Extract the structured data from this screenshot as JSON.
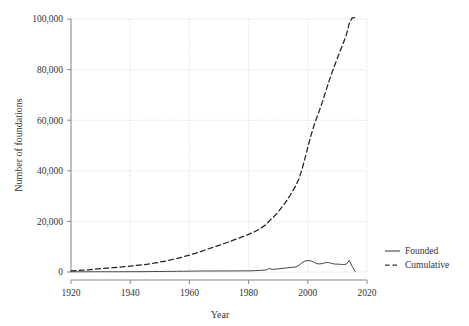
{
  "chart_data": {
    "type": "line",
    "title": "",
    "subtitle": "",
    "xlabel": "Year",
    "ylabel": "Number of foundations",
    "xlim": [
      1920,
      2020
    ],
    "ylim": [
      0,
      100000
    ],
    "xticks": [
      1920,
      1940,
      1960,
      1980,
      2000,
      2020
    ],
    "xtick_labels": [
      "1920",
      "1940",
      "1960",
      "1980",
      "2000",
      "2020"
    ],
    "yticks": [
      0,
      20000,
      40000,
      60000,
      80000,
      100000
    ],
    "ytick_labels": [
      "0",
      "20,000",
      "40,000",
      "60,000",
      "80,000",
      "100,000"
    ],
    "grid": true,
    "grid_style": "dotted",
    "grid_color": "#cccccc",
    "legend_position": "right",
    "legend": [
      "Founded",
      "Cumulative"
    ],
    "x": [
      1920,
      1922,
      1924,
      1926,
      1928,
      1930,
      1932,
      1934,
      1936,
      1938,
      1940,
      1942,
      1944,
      1946,
      1948,
      1950,
      1952,
      1954,
      1956,
      1958,
      1960,
      1962,
      1964,
      1966,
      1968,
      1970,
      1972,
      1974,
      1976,
      1978,
      1980,
      1982,
      1984,
      1986,
      1987,
      1988,
      1990,
      1992,
      1994,
      1996,
      1997,
      1998,
      1999,
      2000,
      2001,
      2002,
      2003,
      2004,
      2005,
      2006,
      2007,
      2008,
      2009,
      2010,
      2011,
      2012,
      2013,
      2014,
      2015,
      2016
    ],
    "series": [
      {
        "name": "Founded",
        "style": "solid",
        "color": "#444444",
        "values": [
          60,
          70,
          80,
          90,
          100,
          110,
          100,
          95,
          100,
          110,
          120,
          110,
          120,
          150,
          180,
          210,
          230,
          250,
          280,
          300,
          330,
          360,
          390,
          400,
          390,
          400,
          410,
          420,
          430,
          440,
          460,
          520,
          640,
          820,
          1400,
          1000,
          1250,
          1500,
          1750,
          2000,
          2600,
          3600,
          4300,
          4500,
          4450,
          3900,
          3300,
          3200,
          3350,
          3700,
          3750,
          3400,
          3150,
          3100,
          3050,
          2950,
          3100,
          4600,
          2200,
          200
        ]
      },
      {
        "name": "Cumulative",
        "style": "dashed",
        "color": "#222222",
        "values": [
          400,
          540,
          700,
          880,
          1080,
          1300,
          1500,
          1690,
          1890,
          2110,
          2350,
          2570,
          2810,
          3110,
          3470,
          3890,
          4350,
          4850,
          5410,
          6010,
          6670,
          7390,
          8170,
          8970,
          9750,
          10550,
          11370,
          12210,
          13070,
          13950,
          14870,
          15910,
          17190,
          18830,
          20230,
          21230,
          23730,
          26730,
          30230,
          34230,
          36830,
          40430,
          44730,
          49230,
          53680,
          57580,
          60880,
          64080,
          67430,
          71130,
          74880,
          78280,
          81430,
          84530,
          87580,
          90530,
          93630,
          98230,
          100430,
          100630
        ]
      }
    ]
  },
  "legend": {
    "items": [
      {
        "label": "Founded",
        "dash": "none"
      },
      {
        "label": "Cumulative",
        "dash": "dashed"
      }
    ]
  }
}
